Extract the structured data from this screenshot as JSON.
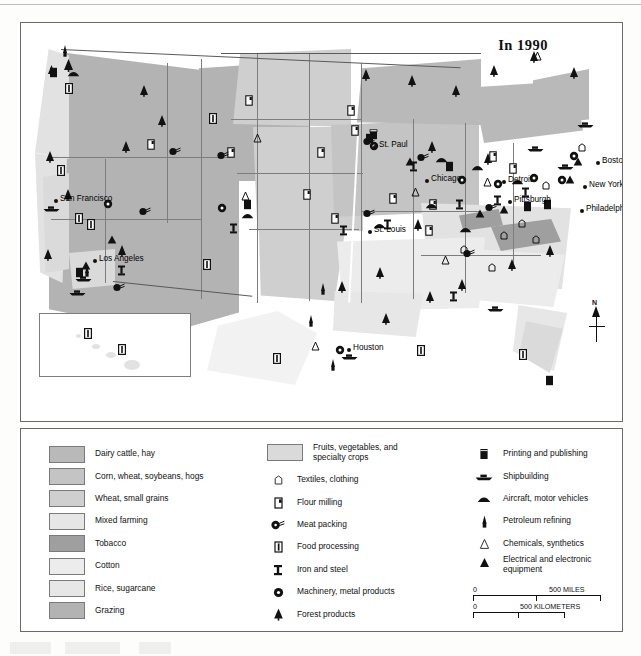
{
  "map": {
    "title": "In 1990",
    "north_arrow_label": "N",
    "cities": [
      {
        "name": "San Francisco",
        "x": 33,
        "y": 176,
        "side": "right"
      },
      {
        "name": "Los Angeles",
        "x": 72,
        "y": 236,
        "side": "right"
      },
      {
        "name": "Houston",
        "x": 326,
        "y": 325,
        "side": "right"
      },
      {
        "name": "St. Louis",
        "x": 347,
        "y": 207,
        "side": "right"
      },
      {
        "name": "St. Paul",
        "x": 352,
        "y": 122,
        "side": "right"
      },
      {
        "name": "Chicago",
        "x": 404,
        "y": 156,
        "side": "right"
      },
      {
        "name": "Detroit",
        "x": 481,
        "y": 157,
        "side": "right"
      },
      {
        "name": "Pittsburgh",
        "x": 487,
        "y": 177,
        "side": "right"
      },
      {
        "name": "Boston",
        "x": 575,
        "y": 138,
        "side": "right"
      },
      {
        "name": "New York",
        "x": 562,
        "y": 162,
        "side": "right"
      },
      {
        "name": "Philadelphia",
        "x": 559,
        "y": 186,
        "side": "right"
      }
    ]
  },
  "legend": {
    "columns": {
      "land_use": [
        {
          "label": "Dairy cattle, hay",
          "color": "#b9b9b9",
          "icon": "color-swatch"
        },
        {
          "label": "Corn, wheat, soybeans, hogs",
          "color": "#c4c4c4",
          "icon": "color-swatch"
        },
        {
          "label": "Wheat, small grains",
          "color": "#cfcfcf",
          "icon": "color-swatch"
        },
        {
          "label": "Mixed farming",
          "color": "#e6e6e6",
          "icon": "color-swatch"
        },
        {
          "label": "Tobacco",
          "color": "#9f9f9f",
          "icon": "color-swatch"
        },
        {
          "label": "Cotton",
          "color": "#ececec",
          "icon": "color-swatch"
        },
        {
          "label": "Rice, sugarcane",
          "color": "#e7e7e7",
          "icon": "color-swatch"
        },
        {
          "label": "Grazing",
          "color": "#b3b3b3",
          "icon": "color-swatch"
        }
      ],
      "industry_a": [
        {
          "label": "Fruits, vegetables, and\nspecialty crops",
          "color": "#dadada",
          "icon": "color-swatch"
        },
        {
          "label": "Textiles, clothing",
          "icon": "textile-spool-icon"
        },
        {
          "label": "Flour milling",
          "icon": "flour-sack-icon"
        },
        {
          "label": "Meat packing",
          "icon": "meat-packing-icon"
        },
        {
          "label": "Food processing",
          "icon": "food-can-icon"
        },
        {
          "label": "Iron and steel",
          "icon": "ibeam-icon"
        },
        {
          "label": "Machinery, metal products",
          "icon": "gear-icon"
        },
        {
          "label": "Forest products",
          "icon": "conifer-tree-icon"
        }
      ],
      "industry_b": [
        {
          "label": "Printing and publishing",
          "icon": "book-icon"
        },
        {
          "label": "Shipbuilding",
          "icon": "ship-icon"
        },
        {
          "label": "Aircraft, motor vehicles",
          "icon": "car-dome-icon"
        },
        {
          "label": "Petroleum refining",
          "icon": "oil-derrick-icon"
        },
        {
          "label": "Chemicals, synthetics",
          "icon": "open-triangle-icon"
        },
        {
          "label": "Electrical and electronic\nequipment",
          "icon": "filled-triangle-icon"
        }
      ]
    },
    "scales": [
      {
        "zero": "0",
        "end": "500  MILES"
      },
      {
        "zero": "0",
        "end": "500 KILOMETERS"
      }
    ]
  }
}
